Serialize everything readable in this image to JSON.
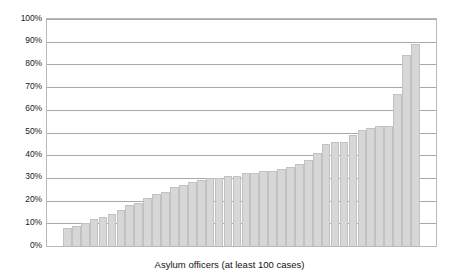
{
  "chart_data": {
    "type": "bar",
    "title": "",
    "subtitle": "",
    "xlabel": "Asylum officers (at least 100 cases)",
    "ylabel": "",
    "ylim": [
      0,
      100
    ],
    "y_ticks": [
      0,
      10,
      20,
      30,
      40,
      50,
      60,
      70,
      80,
      90,
      100
    ],
    "y_tick_labels": [
      "0%",
      "10%",
      "20%",
      "30%",
      "40%",
      "50%",
      "60%",
      "70%",
      "80%",
      "90%",
      "100%"
    ],
    "grid": true,
    "legend": false,
    "legend_position": "none",
    "bar_color": "#d7d7d7",
    "bar_edge_color": "#c2c2c2",
    "categories": [
      "1",
      "2",
      "3",
      "4",
      "5",
      "6",
      "7",
      "8",
      "9",
      "10",
      "11",
      "12",
      "13",
      "14",
      "15",
      "16",
      "17",
      "18",
      "19",
      "20",
      "21",
      "22",
      "23",
      "24",
      "25",
      "26",
      "27",
      "28",
      "29",
      "30",
      "31",
      "32",
      "33",
      "34",
      "35",
      "36",
      "37",
      "38",
      "39",
      "40"
    ],
    "values": [
      8,
      9,
      10,
      12,
      13,
      14,
      16,
      18,
      19,
      21,
      23,
      24,
      26,
      27,
      28,
      29,
      30,
      30,
      31,
      31,
      32,
      32,
      33,
      33,
      34,
      35,
      36,
      38,
      41,
      45,
      46,
      46,
      49,
      51,
      52,
      53,
      53,
      67,
      84,
      89
    ],
    "x_tick_labels": [],
    "annotations": []
  }
}
